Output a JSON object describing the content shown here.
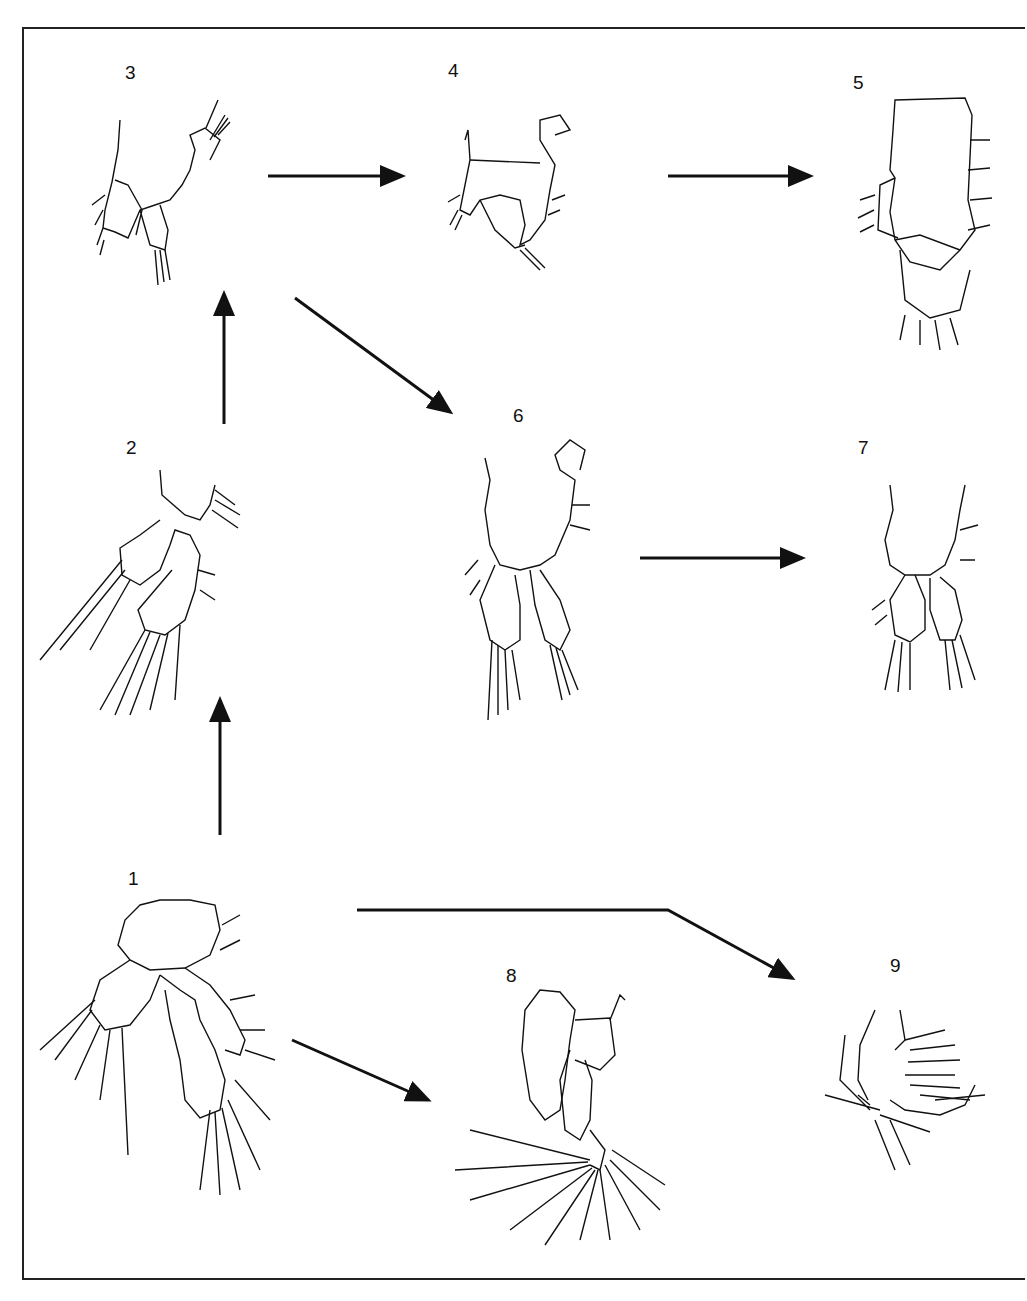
{
  "figure": {
    "labels": {
      "n1": "1",
      "n2": "2",
      "n3": "3",
      "n4": "4",
      "n5": "5",
      "n6": "6",
      "n7": "7",
      "n8": "8",
      "n9": "9"
    },
    "arrows": [
      {
        "from": "3",
        "to": "4"
      },
      {
        "from": "4",
        "to": "5"
      },
      {
        "from": "3",
        "to": "6"
      },
      {
        "from": "2",
        "to": "3"
      },
      {
        "from": "6",
        "to": "7"
      },
      {
        "from": "1",
        "to": "2"
      },
      {
        "from": "1",
        "to": "8"
      },
      {
        "from": "1",
        "to": "9"
      }
    ],
    "line_color": "#111111",
    "background": "#ffffff"
  }
}
